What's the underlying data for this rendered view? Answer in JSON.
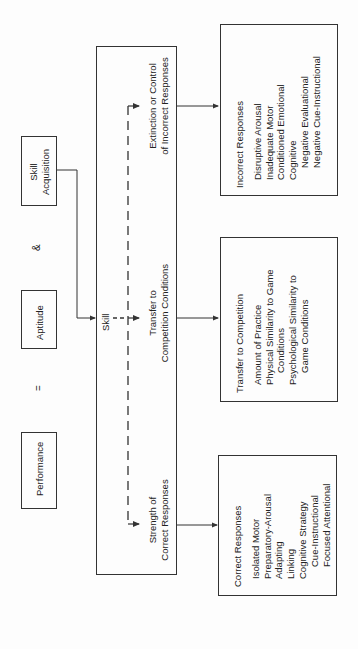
{
  "equation": {
    "performance": "Performance",
    "equals": "=",
    "aptitude": "Aptitude",
    "and": "&",
    "skill_acquisition_line1": "Skill",
    "skill_acquisition_line2": "Acquisition"
  },
  "skill_box": {
    "label": "Skill",
    "components": {
      "strength_line1": "Strength of",
      "strength_line2": "Correct Responses",
      "transfer_line1": "Transfer to",
      "transfer_line2": "Competition Conditions",
      "extinction_line1": "Extinction or Control",
      "extinction_line2": "of Incorrect Responses"
    }
  },
  "outputs": {
    "correct": {
      "title": "Correct Responses",
      "items": [
        {
          "label": "Isolated Motor",
          "level": 1
        },
        {
          "label": "Preparatory-Arousal",
          "level": 1
        },
        {
          "label": "Adapting",
          "level": 1
        },
        {
          "label": "Linking",
          "level": 1
        },
        {
          "label": "Cognitive  Strategy",
          "level": 1
        },
        {
          "label": "Cue-Instructional",
          "level": 2
        },
        {
          "label": "Focused  Attentional",
          "level": 2
        }
      ]
    },
    "transfer": {
      "title": "Transfer to Competition",
      "items": [
        {
          "label": "Amount of Practice",
          "level": 1
        },
        {
          "label": "Physical Similarity to Game",
          "level": 1
        },
        {
          "label": "Conditions",
          "level": 2
        },
        {
          "label": "Psychological Similarity to",
          "level": 1
        },
        {
          "label": "Game Conditions",
          "level": 2
        }
      ]
    },
    "incorrect": {
      "title": "Incorrect Responses",
      "items": [
        {
          "label": "Disruptive Arousal",
          "level": 1
        },
        {
          "label": "Inadequate Motor",
          "level": 1
        },
        {
          "label": "Conditioned Emotional",
          "level": 1
        },
        {
          "label": "Cognitive",
          "level": 1
        },
        {
          "label": "Negative Evaluational",
          "level": 2
        },
        {
          "label": "Negative Cue-Instructional",
          "level": 2
        }
      ]
    }
  },
  "colors": {
    "line": "#333333",
    "background": "#fdfdfd"
  }
}
